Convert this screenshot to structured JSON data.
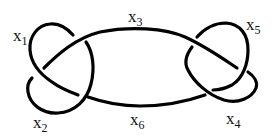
{
  "diagram": {
    "type": "knot-diagram",
    "stroke_color": "#000000",
    "background": "#ffffff",
    "arcs": [
      {
        "id": "x1",
        "base": "x",
        "sub": "1",
        "label_pos": [
          13,
          27
        ]
      },
      {
        "id": "x2",
        "base": "x",
        "sub": "2",
        "label_pos": [
          33,
          114
        ]
      },
      {
        "id": "x3",
        "base": "x",
        "sub": "3",
        "label_pos": [
          128,
          8
        ]
      },
      {
        "id": "x4",
        "base": "x",
        "sub": "4",
        "label_pos": [
          226,
          110
        ]
      },
      {
        "id": "x5",
        "base": "x",
        "sub": "5",
        "label_pos": [
          246,
          16
        ]
      },
      {
        "id": "x6",
        "base": "x",
        "sub": "6",
        "label_pos": [
          130,
          111
        ]
      }
    ]
  }
}
